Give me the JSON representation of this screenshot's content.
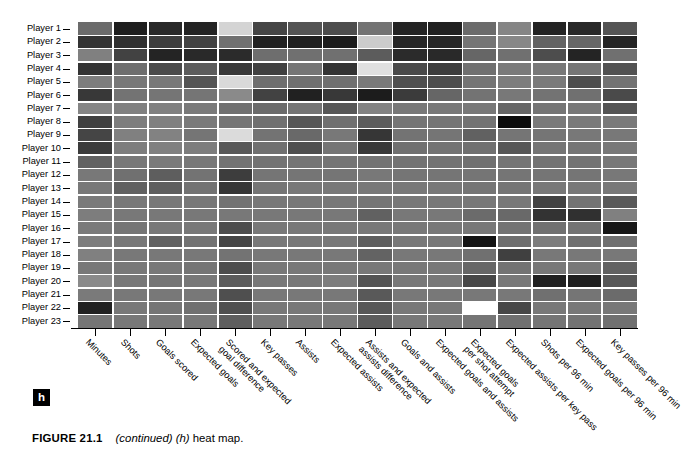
{
  "figure": {
    "panel_letter": "h",
    "caption_number": "FIGURE 21.1",
    "caption_continued": "(continued) (h)",
    "caption_rest": "heat map."
  },
  "chart_data": {
    "type": "heatmap",
    "title": "",
    "xlabel": "",
    "ylabel": "",
    "grid": true,
    "legend": "none",
    "colormap": "grayscale",
    "zlim": [
      0,
      1
    ],
    "row_labels": [
      "Player 1",
      "Player 2",
      "Player 3",
      "Player 4",
      "Player 5",
      "Player 6",
      "Player 7",
      "Player 8",
      "Player 9",
      "Player 10",
      "Player 11",
      "Player 12",
      "Player 13",
      "Player 14",
      "Player 15",
      "Player 16",
      "Player 17",
      "Player 18",
      "Player 19",
      "Player 20",
      "Player 21",
      "Player 22",
      "Player 23"
    ],
    "column_labels": [
      "Minutes",
      "Shots",
      "Goals scored",
      "Expected goals",
      "Scored and expected|goal difference",
      "Key passes",
      "Assists",
      "Expected assists",
      "Assists and expected|assists difference",
      "Goals and assists",
      "Expected goals and assists",
      "Expected goals|per shot attempt",
      "Expected assists per key pass",
      "Shots per 96 min",
      "Expected goals per 96 min",
      "Key passes per 96 min"
    ],
    "values": [
      [
        0.42,
        0.12,
        0.16,
        0.14,
        0.83,
        0.27,
        0.33,
        0.3,
        0.45,
        0.14,
        0.13,
        0.42,
        0.52,
        0.14,
        0.16,
        0.33
      ],
      [
        0.2,
        0.19,
        0.24,
        0.26,
        0.44,
        0.13,
        0.12,
        0.11,
        0.8,
        0.15,
        0.15,
        0.46,
        0.53,
        0.39,
        0.4,
        0.14
      ],
      [
        0.5,
        0.26,
        0.14,
        0.16,
        0.17,
        0.43,
        0.44,
        0.44,
        0.36,
        0.17,
        0.16,
        0.4,
        0.44,
        0.3,
        0.14,
        0.44
      ],
      [
        0.2,
        0.43,
        0.29,
        0.36,
        0.22,
        0.25,
        0.46,
        0.2,
        0.88,
        0.29,
        0.24,
        0.44,
        0.48,
        0.47,
        0.46,
        0.32
      ],
      [
        0.49,
        0.47,
        0.47,
        0.33,
        0.85,
        0.43,
        0.44,
        0.44,
        0.48,
        0.31,
        0.3,
        0.46,
        0.49,
        0.48,
        0.3,
        0.45
      ],
      [
        0.22,
        0.45,
        0.46,
        0.46,
        0.54,
        0.26,
        0.13,
        0.22,
        0.11,
        0.23,
        0.4,
        0.45,
        0.47,
        0.45,
        0.44,
        0.29
      ],
      [
        0.52,
        0.5,
        0.5,
        0.48,
        0.44,
        0.42,
        0.46,
        0.34,
        0.51,
        0.47,
        0.47,
        0.47,
        0.4,
        0.46,
        0.47,
        0.33
      ],
      [
        0.25,
        0.49,
        0.5,
        0.48,
        0.46,
        0.44,
        0.34,
        0.44,
        0.36,
        0.46,
        0.46,
        0.45,
        0.05,
        0.48,
        0.48,
        0.48
      ],
      [
        0.27,
        0.5,
        0.51,
        0.46,
        0.86,
        0.45,
        0.41,
        0.47,
        0.21,
        0.45,
        0.46,
        0.38,
        0.46,
        0.46,
        0.47,
        0.47
      ],
      [
        0.23,
        0.49,
        0.5,
        0.49,
        0.35,
        0.44,
        0.31,
        0.46,
        0.22,
        0.44,
        0.45,
        0.44,
        0.34,
        0.46,
        0.46,
        0.47
      ],
      [
        0.38,
        0.47,
        0.48,
        0.47,
        0.45,
        0.45,
        0.46,
        0.46,
        0.45,
        0.45,
        0.45,
        0.44,
        0.46,
        0.45,
        0.45,
        0.47
      ],
      [
        0.47,
        0.44,
        0.37,
        0.45,
        0.24,
        0.46,
        0.46,
        0.46,
        0.47,
        0.46,
        0.46,
        0.46,
        0.46,
        0.46,
        0.46,
        0.47
      ],
      [
        0.47,
        0.38,
        0.37,
        0.45,
        0.21,
        0.46,
        0.47,
        0.47,
        0.47,
        0.47,
        0.47,
        0.46,
        0.46,
        0.47,
        0.47,
        0.47
      ],
      [
        0.48,
        0.47,
        0.47,
        0.47,
        0.45,
        0.47,
        0.47,
        0.47,
        0.46,
        0.47,
        0.47,
        0.47,
        0.47,
        0.26,
        0.45,
        0.35
      ],
      [
        0.49,
        0.47,
        0.47,
        0.47,
        0.47,
        0.47,
        0.47,
        0.47,
        0.38,
        0.47,
        0.47,
        0.42,
        0.41,
        0.2,
        0.19,
        0.5
      ],
      [
        0.48,
        0.46,
        0.47,
        0.47,
        0.3,
        0.47,
        0.47,
        0.47,
        0.47,
        0.47,
        0.47,
        0.47,
        0.45,
        0.44,
        0.45,
        0.09
      ],
      [
        0.49,
        0.47,
        0.38,
        0.45,
        0.27,
        0.47,
        0.47,
        0.47,
        0.37,
        0.47,
        0.47,
        0.08,
        0.43,
        0.49,
        0.44,
        0.44
      ],
      [
        0.5,
        0.47,
        0.47,
        0.47,
        0.45,
        0.47,
        0.47,
        0.47,
        0.39,
        0.47,
        0.47,
        0.44,
        0.25,
        0.47,
        0.47,
        0.47
      ],
      [
        0.47,
        0.47,
        0.47,
        0.46,
        0.3,
        0.47,
        0.47,
        0.47,
        0.47,
        0.47,
        0.47,
        0.4,
        0.45,
        0.47,
        0.47,
        0.38
      ],
      [
        0.54,
        0.47,
        0.46,
        0.47,
        0.36,
        0.47,
        0.47,
        0.49,
        0.33,
        0.47,
        0.47,
        0.28,
        0.47,
        0.13,
        0.12,
        0.34
      ],
      [
        0.48,
        0.47,
        0.47,
        0.47,
        0.31,
        0.47,
        0.47,
        0.47,
        0.35,
        0.47,
        0.47,
        0.47,
        0.47,
        0.44,
        0.46,
        0.42
      ],
      [
        0.13,
        0.47,
        0.46,
        0.44,
        0.31,
        0.47,
        0.47,
        0.47,
        0.34,
        0.47,
        0.47,
        1.0,
        0.28,
        0.47,
        0.47,
        0.47
      ],
      [
        0.46,
        0.47,
        0.47,
        0.47,
        0.37,
        0.47,
        0.47,
        0.47,
        0.36,
        0.47,
        0.47,
        0.46,
        0.44,
        0.46,
        0.45,
        0.44
      ]
    ]
  }
}
